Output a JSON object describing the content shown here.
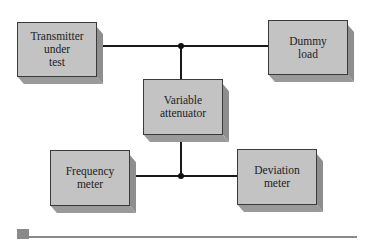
{
  "diagram": {
    "blocks": {
      "transmitter": {
        "lines": [
          "Transmitter",
          "under",
          "test"
        ]
      },
      "dummy_load": {
        "lines": [
          "Dummy",
          "load"
        ]
      },
      "attenuator": {
        "lines": [
          "Variable",
          "attenuator"
        ]
      },
      "frequency_meter": {
        "lines": [
          "Frequency",
          "meter"
        ]
      },
      "deviation_meter": {
        "lines": [
          "Deviation",
          "meter"
        ]
      }
    },
    "connections": [
      {
        "from": "Transmitter under test",
        "to": "Dummy load",
        "via_junction": "top"
      },
      {
        "from": "top junction",
        "to": "Variable attenuator"
      },
      {
        "from": "Variable attenuator",
        "to": "bottom junction"
      },
      {
        "from": "Frequency meter",
        "to": "Deviation meter",
        "via_junction": "bottom"
      }
    ],
    "colors": {
      "block_face": "#c3c3c3",
      "block_shadow": "#8e8e8e",
      "wire": "#1a1a1a",
      "footer_rule": "#8a8a8a"
    }
  }
}
